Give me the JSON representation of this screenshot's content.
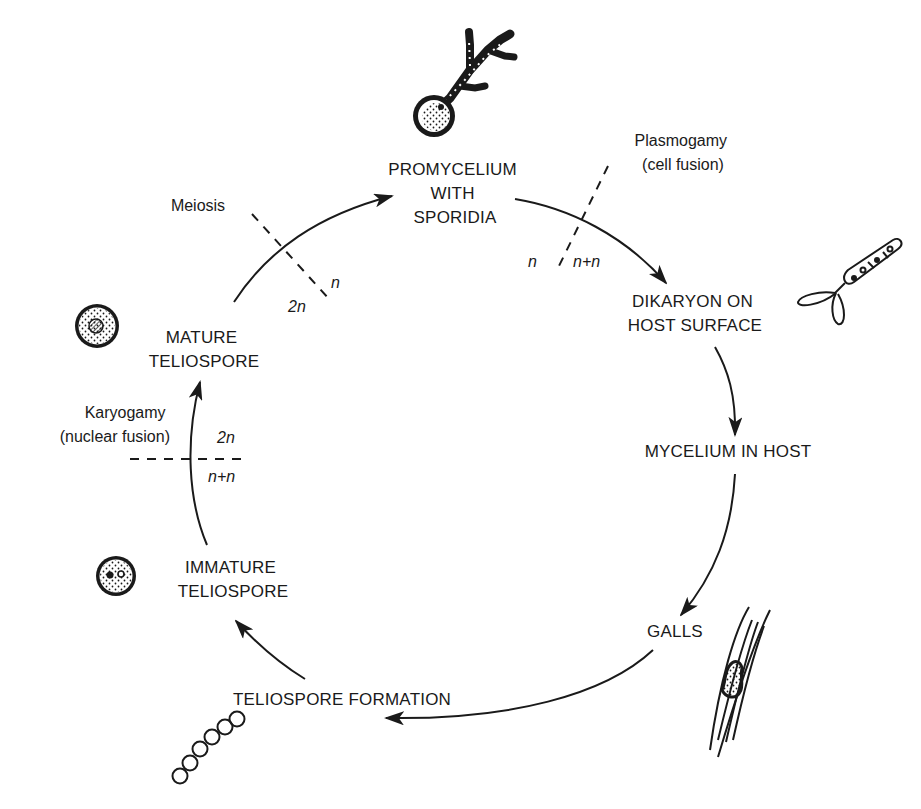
{
  "diagram": {
    "type": "life-cycle",
    "stages": [
      {
        "id": "promycelium",
        "lines": [
          "PROMYCELIUM",
          "WITH",
          "SPORIDIA"
        ],
        "icon": "promycelium-sporidia-icon"
      },
      {
        "id": "dikaryon",
        "lines": [
          "DIKARYON ON",
          "HOST SURFACE"
        ],
        "icon": "dikaryon-hypha-icon"
      },
      {
        "id": "mycelium",
        "lines": [
          "MYCELIUM IN HOST"
        ]
      },
      {
        "id": "galls",
        "lines": [
          "GALLS"
        ],
        "icon": "gall-on-stem-icon"
      },
      {
        "id": "formation",
        "lines": [
          "TELIOSPORE FORMATION"
        ],
        "icon": "teliospore-chain-icon"
      },
      {
        "id": "immature",
        "lines": [
          "IMMATURE",
          "TELIOSPORE"
        ],
        "icon": "immature-teliospore-icon"
      },
      {
        "id": "mature",
        "lines": [
          "MATURE",
          "TELIOSPORE"
        ],
        "icon": "mature-teliospore-icon"
      }
    ],
    "events": [
      {
        "id": "plasmogamy",
        "lines": [
          "Plasmogamy",
          "(cell fusion)"
        ],
        "before": "n",
        "after": "n+n"
      },
      {
        "id": "karyogamy",
        "lines": [
          "Karyogamy",
          "(nuclear fusion)"
        ],
        "before": "n+n",
        "after": "2n"
      },
      {
        "id": "meiosis",
        "lines": [
          "Meiosis"
        ],
        "before": "2n",
        "after": "n"
      }
    ],
    "edges": [
      {
        "from": "mature",
        "to": "promycelium"
      },
      {
        "from": "promycelium",
        "to": "dikaryon"
      },
      {
        "from": "dikaryon",
        "to": "mycelium"
      },
      {
        "from": "mycelium",
        "to": "galls"
      },
      {
        "from": "galls",
        "to": "formation"
      },
      {
        "from": "formation",
        "to": "immature"
      },
      {
        "from": "immature",
        "to": "mature"
      }
    ]
  }
}
